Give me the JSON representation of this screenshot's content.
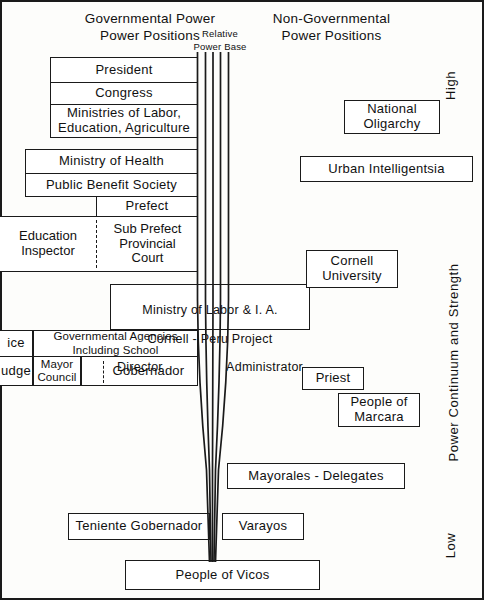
{
  "figure": {
    "headers": {
      "governmental": "Governmental Power\nPower Positions",
      "relative_power_base": "Relative\nPower Base",
      "non_governmental": "Non-Governmental\nPower Positions"
    },
    "axis": {
      "high": "High",
      "low": "Low",
      "continuum": "Power Continuum and Strength"
    }
  },
  "governmental": [
    {
      "id": "president",
      "label": "President"
    },
    {
      "id": "congress",
      "label": "Congress"
    },
    {
      "id": "ministries",
      "label": "Ministries of Labor,\nEducation, Agriculture"
    },
    {
      "id": "ministry-health",
      "label": "Ministry of Health"
    },
    {
      "id": "public-benefit-society",
      "label": "Public Benefit Society"
    },
    {
      "id": "prefect",
      "label": "Prefect"
    },
    {
      "id": "education-inspector",
      "label": "Education\nInspector"
    },
    {
      "id": "sub-prefect",
      "label": "Sub Prefect\nProvincial\nCourt"
    },
    {
      "id": "police",
      "label": "ice"
    },
    {
      "id": "governmental-agencies",
      "label": "Governmental Agencies\nIncluding  School"
    },
    {
      "id": "judge",
      "label": "udge"
    },
    {
      "id": "mayor-council",
      "label": "Mayor\nCouncil"
    },
    {
      "id": "gobernador",
      "label": "Gobernador"
    },
    {
      "id": "teniente-gobernador",
      "label": "Teniente  Gobernador"
    }
  ],
  "bridge": {
    "id": "ministry-labor-cornell",
    "line1": "Ministry of Labor & I. A.",
    "line2": "Cornell - Peru Project",
    "left_role": "Director",
    "right_role": "Administrator"
  },
  "non_governmental": [
    {
      "id": "national-oligarchy",
      "label": "National\nOligarchy"
    },
    {
      "id": "urban-intelligentsia",
      "label": "Urban  Intelligentsia"
    },
    {
      "id": "cornell-university",
      "label": "Cornell\nUniversity"
    },
    {
      "id": "priest",
      "label": "Priest"
    },
    {
      "id": "people-of-marcara",
      "label": "People of\nMarcara"
    },
    {
      "id": "mayorales-delegates",
      "label": "Mayorales - Delegates"
    },
    {
      "id": "varayos",
      "label": "Varayos"
    }
  ],
  "base": {
    "id": "people-of-vicos",
    "label": "People of Vicos"
  },
  "colors": {
    "ink": "#1a1a1a",
    "paper": "#fdfdfb"
  }
}
